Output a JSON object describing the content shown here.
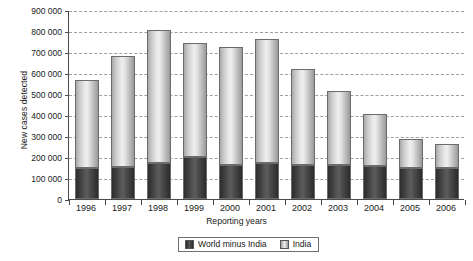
{
  "chart_data": {
    "type": "bar",
    "stacked": true,
    "title": "",
    "xlabel": "Reporting years",
    "ylabel": "New cases detected",
    "categories": [
      "1996",
      "1997",
      "1998",
      "1999",
      "2000",
      "2001",
      "2002",
      "2003",
      "2004",
      "2005",
      "2006"
    ],
    "series": [
      {
        "name": "World minus India",
        "color": "#3f3f3f",
        "values": [
          147000,
          152000,
          172000,
          200000,
          161000,
          172000,
          162000,
          162000,
          157000,
          150000,
          150000
        ]
      },
      {
        "name": "India",
        "color": "#dcdcdc",
        "values": [
          418000,
          531000,
          635000,
          542000,
          563000,
          590000,
          458000,
          353000,
          248000,
          137000,
          112000
        ]
      }
    ],
    "totals": [
      565000,
      683000,
      807000,
      742000,
      724000,
      762000,
      620000,
      515000,
      405000,
      287000,
      262000
    ],
    "ylim": [
      0,
      900000
    ],
    "ytick_values": [
      0,
      100000,
      200000,
      300000,
      400000,
      500000,
      600000,
      700000,
      800000,
      900000
    ],
    "ytick_labels": [
      "0",
      "100 000",
      "200 000",
      "300 000",
      "400 000",
      "500 000",
      "600 000",
      "700 000",
      "800 000",
      "900 000"
    ],
    "grid": true,
    "grid_style": "dashed",
    "legend_position": "bottom",
    "legend_entries": [
      "World minus India",
      "India"
    ]
  }
}
